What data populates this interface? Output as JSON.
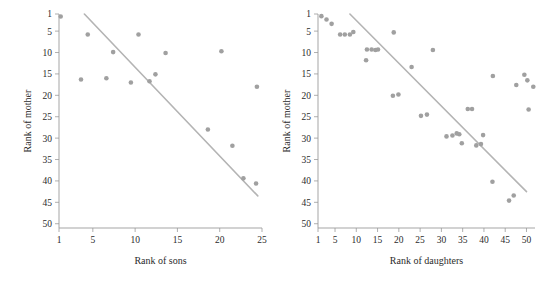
{
  "figure": {
    "background": "#ffffff",
    "point_color": "#a0a0a0",
    "line_color": "#b4b4b4",
    "axis_color": "#9b9b9b"
  },
  "chart_data": [
    {
      "type": "scatter",
      "title": "",
      "xlabel": "Rank of sons",
      "ylabel": "Rank of mother",
      "xlim": [
        1,
        25
      ],
      "ylim": [
        1,
        51
      ],
      "y_inverted": true,
      "grid": false,
      "legend": "none",
      "xticks": [
        1,
        5,
        10,
        15,
        20,
        25
      ],
      "yticks": [
        1,
        5,
        10,
        15,
        20,
        25,
        30,
        35,
        40,
        45,
        50
      ],
      "x": [
        1.2,
        3.6,
        4.4,
        6.6,
        7.4,
        9.5,
        10.4,
        11.7,
        12.4,
        13.6,
        18.6,
        20.2,
        21.5,
        22.8,
        24.3,
        24.4
      ],
      "y": [
        1.6,
        16.3,
        5.8,
        16.0,
        9.9,
        17.0,
        5.8,
        16.7,
        15.1,
        10.1,
        28.0,
        9.7,
        31.8,
        39.4,
        40.6,
        18.0
      ],
      "fit_line": {
        "x1": 4.0,
        "y1": 1.0,
        "x2": 24.5,
        "y2": 43.5
      }
    },
    {
      "type": "scatter",
      "title": "",
      "xlabel": "Rank of daughters",
      "ylabel": "Rank of mother",
      "xlim": [
        1,
        52
      ],
      "ylim": [
        1,
        51
      ],
      "y_inverted": true,
      "grid": false,
      "legend": "none",
      "xticks": [
        1,
        5,
        10,
        15,
        20,
        25,
        30,
        35,
        40,
        45,
        50
      ],
      "yticks": [
        1,
        5,
        10,
        15,
        20,
        25,
        30,
        35,
        40,
        45,
        50
      ],
      "x": [
        1.8,
        3.0,
        4.2,
        6.2,
        7.3,
        8.5,
        9.3,
        12.3,
        12.5,
        13.6,
        14.5,
        15.1,
        18.6,
        18.8,
        19.9,
        23.0,
        25.2,
        26.6,
        28.0,
        31.2,
        32.6,
        33.6,
        34.2,
        34.8,
        36.2,
        37.2,
        38.2,
        39.3,
        39.8,
        42.0,
        42.1,
        45.9,
        47.0,
        47.6,
        49.5,
        50.2,
        50.5,
        51.6
      ],
      "y": [
        1.5,
        2.3,
        3.3,
        5.8,
        5.8,
        5.8,
        5.2,
        11.8,
        9.3,
        9.3,
        9.4,
        9.3,
        20.1,
        5.3,
        19.8,
        13.4,
        24.8,
        24.5,
        9.4,
        29.6,
        29.4,
        28.9,
        29.1,
        31.2,
        23.2,
        23.2,
        31.7,
        31.4,
        29.3,
        40.2,
        15.5,
        44.6,
        43.4,
        17.6,
        15.2,
        16.5,
        23.3,
        18.0
      ],
      "fit_line": {
        "x1": 8.5,
        "y1": 1.0,
        "x2": 50.0,
        "y2": 42.5
      }
    }
  ]
}
